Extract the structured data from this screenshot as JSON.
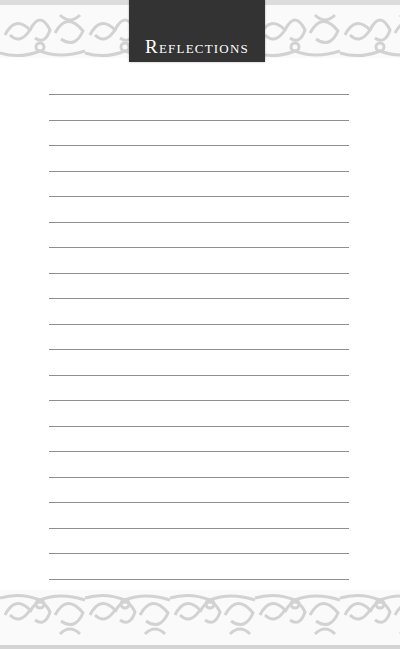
{
  "page": {
    "title": "Reflections",
    "ruled_lines": {
      "count": 20,
      "first_y": 94,
      "spacing": 25.5,
      "left_x": 49,
      "width": 300,
      "color": "#8e8e8e"
    },
    "colors": {
      "title_box": "#333333",
      "title_text": "#ffffff",
      "ornament": "#d6d6d6",
      "background": "#ffffff"
    },
    "decorations": {
      "top_border": "ornamental-scroll-border",
      "bottom_border": "ornamental-scroll-border"
    }
  }
}
